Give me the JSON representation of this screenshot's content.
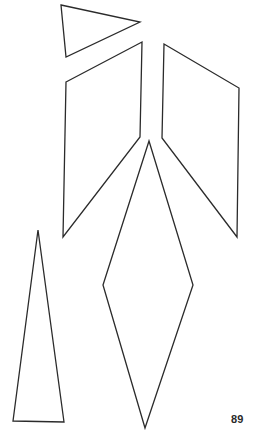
{
  "page": {
    "number": "89",
    "stroke_color": "#2b2b2b",
    "background": "#ffffff"
  },
  "shapes": [
    {
      "name": "small-triangle",
      "type": "triangle",
      "points": "61,5 140,22 66,57"
    },
    {
      "name": "left-parallelogram",
      "type": "quadrilateral",
      "points": "66,82 142,42 140,137 63,237"
    },
    {
      "name": "right-parallelogram",
      "type": "quadrilateral",
      "points": "164,44 239,88 237,237 162,138"
    },
    {
      "name": "tall-diamond",
      "type": "rhombus",
      "points": "149,141 193,285 145,428 103,285"
    },
    {
      "name": "tall-triangle",
      "type": "triangle",
      "points": "38,230 64,422 13,421"
    }
  ]
}
